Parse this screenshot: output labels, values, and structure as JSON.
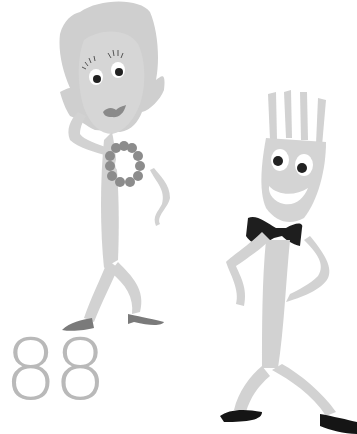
{
  "illustration": {
    "number_text": "88",
    "characters": [
      {
        "name": "spoon-lady",
        "description": "Cartoon spoon character with hair, necklace, lipstick and heels"
      },
      {
        "name": "fork-man",
        "description": "Cartoon fork character wearing a black bow tie and shoes"
      }
    ],
    "colors": {
      "body": "#d4d4d4",
      "hair": "#cfcfcf",
      "accent_dark": "#8a8a8a",
      "necklace": "#8c8c8c",
      "bowtie": "#1e1e1e",
      "shoes_fork": "#151515",
      "shoes_spoon": "#7a7a7a",
      "number": "#b9b9b9",
      "background": "#ffffff"
    }
  }
}
